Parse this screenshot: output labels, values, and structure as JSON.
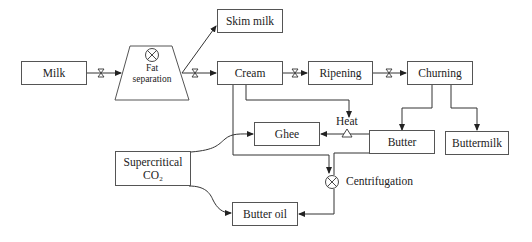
{
  "diagram": {
    "nodes": {
      "milk": "Milk",
      "fat_separation_line1": "Fat",
      "fat_separation_line2": "separation",
      "skim_milk": "Skim milk",
      "cream": "Cream",
      "ripening": "Ripening",
      "churning": "Churning",
      "butter": "Butter",
      "buttermilk": "Buttermilk",
      "ghee": "Ghee",
      "heat": "Heat",
      "supercritical_line1": "Supercritical",
      "supercritical_line2": "CO₂",
      "centrifugation": "Centrifugation",
      "butter_oil": "Butter oil"
    },
    "edges": [
      {
        "from": "Milk",
        "to": "Fat separation",
        "valve": true
      },
      {
        "from": "Fat separation",
        "to": "Skim milk"
      },
      {
        "from": "Fat separation",
        "to": "Cream",
        "valve": true
      },
      {
        "from": "Cream",
        "to": "Ripening",
        "valve": true
      },
      {
        "from": "Ripening",
        "to": "Churning",
        "valve": true
      },
      {
        "from": "Churning",
        "to": "Butter"
      },
      {
        "from": "Churning",
        "to": "Buttermilk"
      },
      {
        "from": "Cream",
        "to": "Heat"
      },
      {
        "from": "Butter",
        "to": "Ghee",
        "via": "Heat"
      },
      {
        "from": "Cream",
        "to": "Centrifugation"
      },
      {
        "from": "Butter",
        "to": "Centrifugation"
      },
      {
        "from": "Centrifugation",
        "to": "Butter oil"
      },
      {
        "from": "Supercritical CO2",
        "to": "Ghee"
      },
      {
        "from": "Supercritical CO2",
        "to": "Butter oil"
      }
    ],
    "colors": {
      "line": "#333333",
      "box_border": "#555555",
      "background": "#ffffff"
    }
  }
}
